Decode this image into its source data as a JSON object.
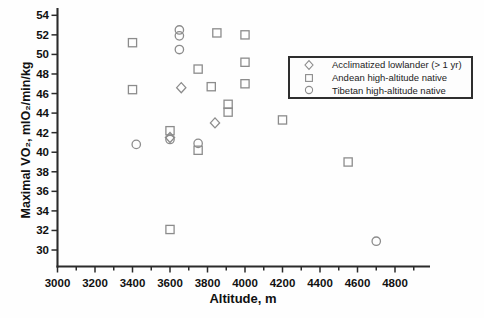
{
  "figure": {
    "background": "#fefefe",
    "marker_color": "#8c8c8c",
    "axis_color": "#2b2b2b",
    "text_color": "#111111",
    "legend_border_color": "#2e2e2e"
  },
  "chart_data": {
    "type": "scatter",
    "title": "",
    "xlabel": "Altitude, m",
    "ylabel": "Maximal VO₂, mlO₂/min/kg",
    "xlim": [
      3000,
      4900
    ],
    "ylim": [
      29,
      54.5
    ],
    "x_ticks": [
      3000,
      3200,
      3400,
      3600,
      3800,
      4000,
      4200,
      4400,
      4600,
      4800
    ],
    "y_ticks": [
      30,
      32,
      34,
      36,
      38,
      40,
      42,
      44,
      46,
      48,
      50,
      52,
      54
    ],
    "grid": false,
    "legend_position": "inside upper right",
    "series": [
      {
        "name": "Acclimatized lowlander (> 1 yr)",
        "marker": "diamond",
        "points": [
          [
            3600,
            41.5
          ],
          [
            3660,
            46.6
          ],
          [
            3840,
            43.0
          ]
        ]
      },
      {
        "name": "Andean high-altitude native",
        "marker": "square",
        "points": [
          [
            3400,
            51.2
          ],
          [
            3400,
            46.4
          ],
          [
            3600,
            42.2
          ],
          [
            3600,
            32.1
          ],
          [
            3750,
            48.5
          ],
          [
            3750,
            40.2
          ],
          [
            3820,
            46.7
          ],
          [
            3850,
            52.2
          ],
          [
            3910,
            44.9
          ],
          [
            3910,
            44.1
          ],
          [
            4000,
            52.0
          ],
          [
            4000,
            49.2
          ],
          [
            4000,
            47.0
          ],
          [
            4200,
            43.3
          ],
          [
            4550,
            39.0
          ]
        ]
      },
      {
        "name": "Tibetan high-altitude native",
        "marker": "circle",
        "points": [
          [
            3420,
            40.8
          ],
          [
            3600,
            41.3
          ],
          [
            3650,
            52.5
          ],
          [
            3650,
            51.9
          ],
          [
            3650,
            50.5
          ],
          [
            3750,
            40.9
          ],
          [
            4700,
            30.9
          ]
        ]
      }
    ]
  }
}
